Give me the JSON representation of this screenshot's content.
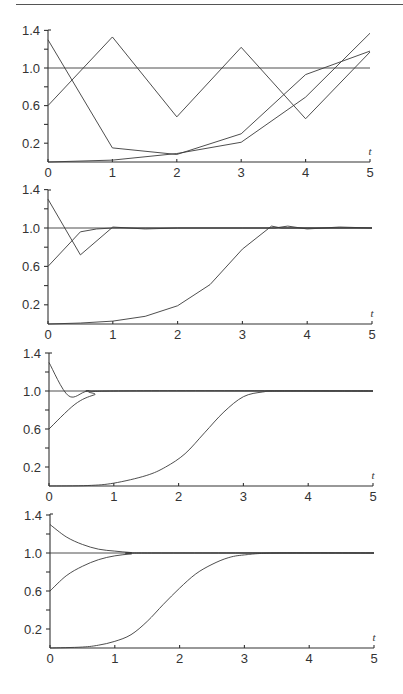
{
  "figure": {
    "panel_count": 4,
    "line_color": "#3a3a3a",
    "background": "#ffffff"
  },
  "chart_data": [
    {
      "type": "line",
      "panel": 1,
      "xlabel": "t",
      "ylabel": "",
      "xlim": [
        0,
        5
      ],
      "ylim": [
        0,
        1.45
      ],
      "xticks": [
        "0",
        "1",
        "2",
        "3",
        "4",
        "5"
      ],
      "yticks": [
        "0.2",
        "0.6",
        "1.0",
        "1.4"
      ],
      "grid": false,
      "reference_line": 1.0,
      "layout": {
        "x0": 48,
        "x5": 370,
        "y_zero": 162,
        "y_one": 68,
        "y_top": 30
      },
      "series": [
        {
          "name": "curve-start-1.3",
          "x": [
            0,
            1,
            2,
            3,
            4,
            5
          ],
          "values": [
            1.3,
            0.15,
            0.08,
            0.3,
            0.93,
            1.18
          ]
        },
        {
          "name": "curve-start-0.6",
          "x": [
            0,
            1,
            2,
            3,
            4,
            5
          ],
          "values": [
            0.6,
            1.33,
            0.48,
            1.22,
            0.46,
            1.17
          ]
        },
        {
          "name": "curve-start-0",
          "x": [
            0,
            1,
            2,
            3,
            4,
            5
          ],
          "values": [
            0.0,
            0.02,
            0.09,
            0.21,
            0.69,
            1.37
          ]
        }
      ]
    },
    {
      "type": "line",
      "panel": 2,
      "xlabel": "t",
      "ylabel": "",
      "xlim": [
        0,
        5
      ],
      "ylim": [
        0,
        1.45
      ],
      "xticks": [
        "0",
        "1",
        "2",
        "3",
        "4",
        "5"
      ],
      "yticks": [
        "0.2",
        "0.6",
        "1.0",
        "1.4"
      ],
      "grid": false,
      "reference_line": 1.0,
      "layout": {
        "x0": 48,
        "x5": 372,
        "y_zero": 324,
        "y_one": 228,
        "y_top": 190
      },
      "series": [
        {
          "name": "curve-start-1.3",
          "x": [
            0,
            0.5,
            1,
            1.5,
            2,
            2.5,
            3,
            3.5,
            3.7,
            4,
            4.5,
            5
          ],
          "values": [
            1.3,
            0.72,
            1.01,
            0.99,
            1.0,
            1.0,
            1.0,
            1.0,
            1.02,
            0.99,
            1.01,
            1.0
          ]
        },
        {
          "name": "curve-start-0.6",
          "x": [
            0,
            0.5,
            0.75,
            1,
            1.5,
            2,
            5
          ],
          "values": [
            0.6,
            0.96,
            0.99,
            1.0,
            1.0,
            1.0,
            1.0
          ]
        },
        {
          "name": "curve-start-0",
          "x": [
            0,
            0.5,
            1,
            1.5,
            2,
            2.5,
            3,
            3.45,
            3.6,
            4,
            5
          ],
          "values": [
            0.0,
            0.01,
            0.03,
            0.08,
            0.19,
            0.41,
            0.78,
            1.02,
            1.0,
            1.0,
            1.0
          ]
        }
      ]
    },
    {
      "type": "line",
      "panel": 3,
      "xlabel": "t",
      "ylabel": "",
      "xlim": [
        0,
        5
      ],
      "ylim": [
        0,
        1.45
      ],
      "xticks": [
        "0",
        "1",
        "2",
        "3",
        "4",
        "5"
      ],
      "yticks": [
        "0.2",
        "0.6",
        "1.0",
        "1.4"
      ],
      "grid": false,
      "reference_line": 1.0,
      "layout": {
        "x0": 49,
        "x5": 373,
        "y_zero": 486,
        "y_one": 391,
        "y_top": 353
      },
      "series": [
        {
          "name": "curve-start-1.3",
          "x": [
            0,
            0.3,
            0.6,
            1,
            5
          ],
          "values": [
            1.3,
            0.95,
            1.0,
            1.0,
            1.0
          ]
        },
        {
          "name": "curve-start-0.6",
          "x": [
            0,
            0.4,
            0.7,
            1,
            5
          ],
          "values": [
            0.6,
            0.86,
            0.96,
            1.0,
            1.0
          ]
        },
        {
          "name": "curve-start-0",
          "x": [
            0,
            0.6,
            1,
            1.5,
            1.8,
            2.1,
            2.4,
            2.7,
            3,
            3.3,
            3.6,
            5
          ],
          "values": [
            0.0,
            0.005,
            0.03,
            0.11,
            0.2,
            0.34,
            0.56,
            0.78,
            0.94,
            0.99,
            1.0,
            1.0
          ]
        }
      ]
    },
    {
      "type": "line",
      "panel": 4,
      "xlabel": "t",
      "ylabel": "",
      "xlim": [
        0,
        5
      ],
      "ylim": [
        0,
        1.45
      ],
      "xticks": [
        "0",
        "1",
        "2",
        "3",
        "4",
        "5"
      ],
      "yticks": [
        "0.2",
        "0.6",
        "1.0",
        "1.4"
      ],
      "grid": false,
      "reference_line": 1.0,
      "layout": {
        "x0": 50,
        "x5": 374,
        "y_zero": 648,
        "y_one": 553,
        "y_top": 514
      },
      "series": [
        {
          "name": "curve-start-1.3",
          "x": [
            0,
            0.25,
            0.5,
            0.75,
            1,
            1.25,
            1.5,
            5
          ],
          "values": [
            1.3,
            1.17,
            1.09,
            1.04,
            1.02,
            1.005,
            1.0,
            1.0
          ]
        },
        {
          "name": "curve-start-0.6",
          "x": [
            0,
            0.25,
            0.5,
            0.75,
            1,
            1.25,
            1.5,
            5
          ],
          "values": [
            0.6,
            0.76,
            0.86,
            0.93,
            0.97,
            0.99,
            1.0,
            1.0
          ]
        },
        {
          "name": "curve-start-0",
          "x": [
            0,
            0.5,
            0.75,
            1,
            1.25,
            1.5,
            1.75,
            2,
            2.25,
            2.5,
            2.75,
            3,
            3.5,
            5
          ],
          "values": [
            0.0,
            0.01,
            0.03,
            0.07,
            0.14,
            0.28,
            0.46,
            0.63,
            0.78,
            0.88,
            0.95,
            0.98,
            1.0,
            1.0
          ]
        }
      ]
    }
  ]
}
